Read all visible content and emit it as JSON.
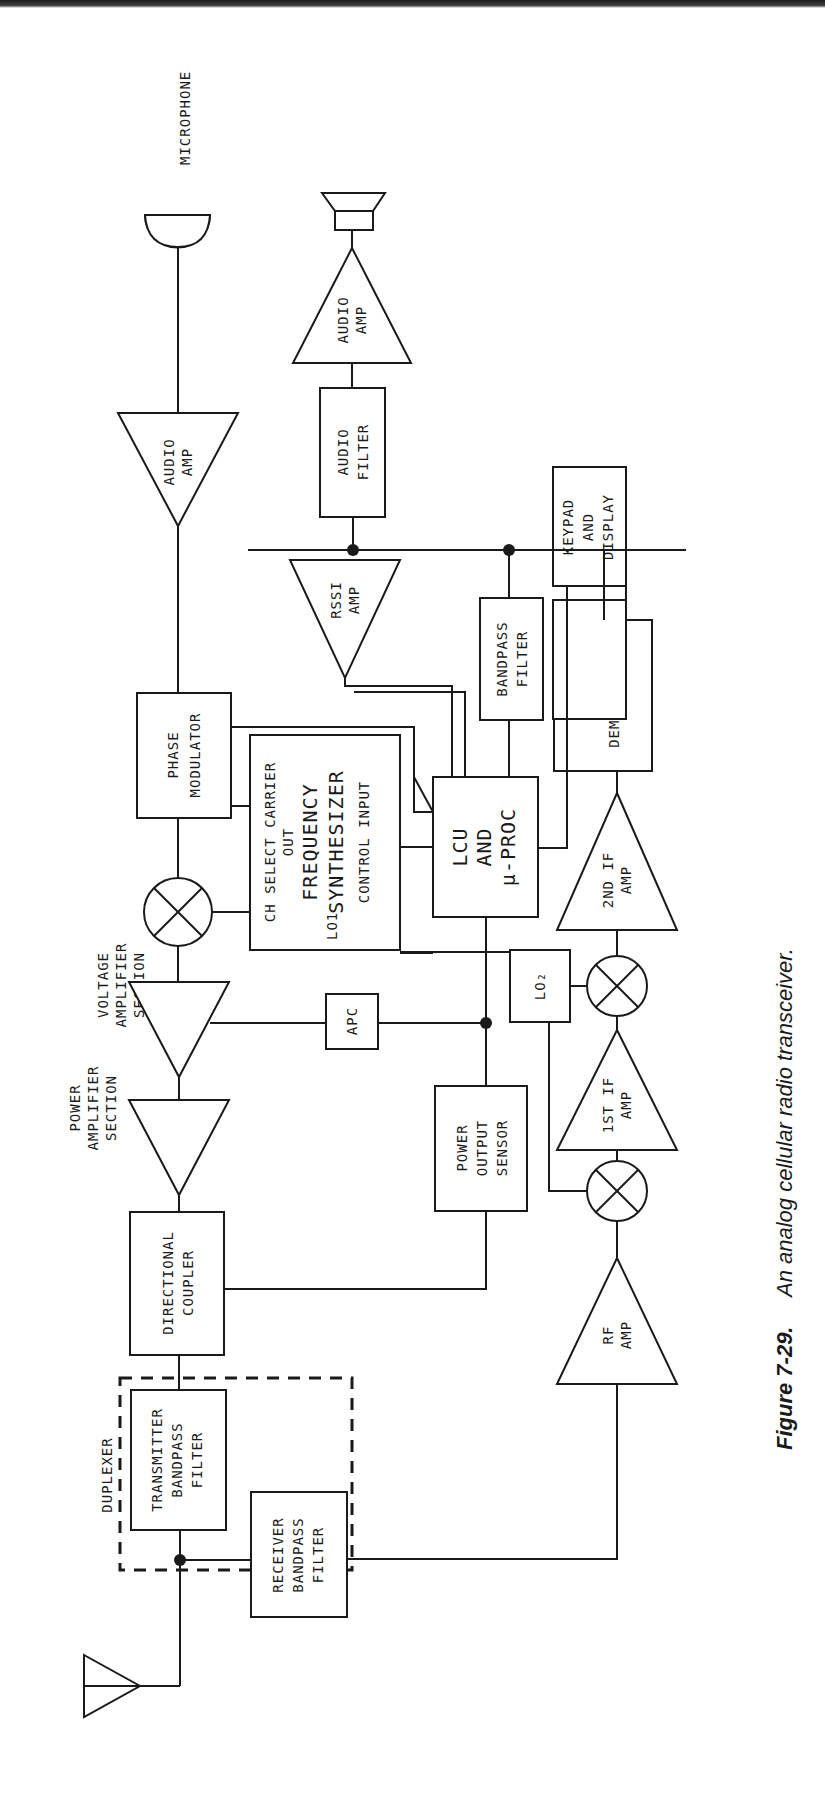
{
  "figure": {
    "caption_number": "Figure 7-29.",
    "caption_text": "An analog cellular radio transceiver.",
    "orientation": "rotated 90° (read with page turned clockwise)"
  },
  "blocks": {
    "microphone": "MICROPHONE",
    "tx_audio_amp": [
      "AUDIO",
      "AMP"
    ],
    "phase_modulator": [
      "PHASE",
      "MODULATOR"
    ],
    "freq_synth": {
      "top": "CH SELECT CARRIER",
      "out": "OUT",
      "title1": "FREQUENCY",
      "title2": "SYNTHESIZER",
      "lo1": "LO1",
      "ctrl": "CONTROL INPUT"
    },
    "voltage_amp_label": [
      "VOLTAGE",
      "AMPLIFIER",
      "SECTION"
    ],
    "power_amp_label": [
      "POWER",
      "AMPLIFIER",
      "SECTION"
    ],
    "apc": "APC",
    "power_output_sensor": [
      "POWER",
      "OUTPUT",
      "SENSOR"
    ],
    "directional_coupler": [
      "DIRECTIONAL",
      "COUPLER"
    ],
    "duplexer": "DUPLEXER",
    "tx_bandpass": [
      "TRANSMITTER",
      "BANDPASS",
      "FILTER"
    ],
    "rx_bandpass": [
      "RECEIVER",
      "BANDPASS",
      "FILTER"
    ],
    "rf_amp": [
      "RF",
      "AMP"
    ],
    "if1_amp": [
      "1ST IF",
      "AMP"
    ],
    "lo2": "LO₂",
    "if2_amp": [
      "2ND IF",
      "AMP"
    ],
    "fm_demod": [
      "FM",
      "DEMODULATOR"
    ],
    "lcu": [
      "LCU",
      "AND",
      "µ-PROC"
    ],
    "bandpass_filter": [
      "BANDPASS",
      "FILTER"
    ],
    "keypad": [
      "KEYPAD",
      "AND",
      "DISPLAY"
    ],
    "rssi_amp": [
      "RSSI",
      "AMP"
    ],
    "audio_filter": [
      "AUDIO",
      "FILTER"
    ],
    "rx_audio_amp": [
      "AUDIO",
      "AMP"
    ],
    "speaker": "speaker",
    "antenna": "antenna"
  }
}
